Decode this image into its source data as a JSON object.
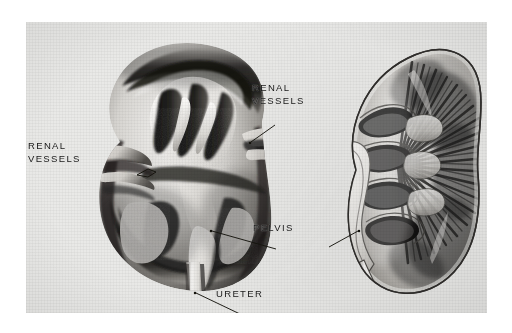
{
  "plate": {
    "kind": "anatomical-halftone-plate",
    "medium": "black-and-white photographic illustration",
    "subject": "Kidney — gross anatomy, two specimens",
    "background_color": "#e9e9e7",
    "ink_color": "#181818",
    "page_color": "#ffffff"
  },
  "labels": {
    "renal_vessels_left": "RENAL\nVESSELS",
    "renal_vessels_left_line1": "RENAL",
    "renal_vessels_left_line2": "VESSELS",
    "renal_vessels_right_line1": "RENAL",
    "renal_vessels_right_line2": "VESSELS",
    "pelvis": "PELVIS",
    "ureter": "URETER"
  },
  "specimens": [
    {
      "id": "left-specimen",
      "name": "Dissected kidney — anterior lip reflected, pelvis and calyces exposed",
      "position": "left",
      "structures": [
        "renal capsule",
        "cortex",
        "renal pelvis",
        "major calyces",
        "minor calyces",
        "renal vessels",
        "ureter"
      ]
    },
    {
      "id": "right-specimen",
      "name": "Bisected kidney — longitudinal section showing medullary pyramids",
      "position": "right",
      "structures": [
        "cortex",
        "medullary pyramids",
        "renal columns",
        "minor calyces",
        "major calyces",
        "renal pelvis",
        "ureter"
      ]
    }
  ],
  "leader_lines": [
    {
      "from": "renal_vessels_left",
      "to": "left-specimen-hilum-vessels",
      "style": "bracket"
    },
    {
      "from": "renal_vessels_right",
      "to": "left-specimen-upper-vessels",
      "style": "line"
    },
    {
      "from": "pelvis",
      "to": "left-specimen-pelvis",
      "style": "line"
    },
    {
      "from": "pelvis",
      "to": "right-specimen-pelvis",
      "style": "line"
    },
    {
      "from": "ureter",
      "to": "left-specimen-ureter",
      "style": "line"
    }
  ]
}
